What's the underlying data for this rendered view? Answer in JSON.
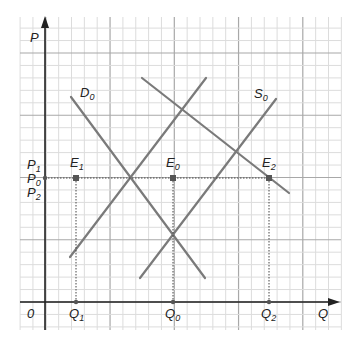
{
  "diagram": {
    "type": "supply-demand",
    "axes": {
      "y_label": "P",
      "x_label": "Q",
      "origin_label": "0"
    },
    "price_labels": [
      {
        "base": "P",
        "sub": "1"
      },
      {
        "base": "P",
        "sub": "0"
      },
      {
        "base": "P",
        "sub": "2"
      }
    ],
    "quantity_labels": [
      {
        "base": "Q",
        "sub": "1"
      },
      {
        "base": "Q",
        "sub": "0"
      },
      {
        "base": "Q",
        "sub": "2"
      }
    ],
    "curve_labels": {
      "demand": {
        "base": "D",
        "sub": "0"
      },
      "supply": {
        "base": "S",
        "sub": "0"
      }
    },
    "equilibria": [
      {
        "base": "E",
        "sub": "1",
        "x": 76,
        "y": 178
      },
      {
        "base": "E",
        "sub": "0",
        "x": 173,
        "y": 178
      },
      {
        "base": "E",
        "sub": "2",
        "x": 269,
        "y": 178
      }
    ],
    "colors": {
      "curve": "#7a7a7a",
      "axis": "#222222",
      "grid_minor": "#dcdcdc",
      "grid_major": "#a8a8a8",
      "point": "#555555"
    }
  }
}
